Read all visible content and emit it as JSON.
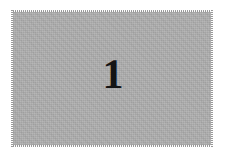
{
  "figure": {
    "kind": "scanned-plate",
    "number_label": "1",
    "caption": "",
    "plate": {
      "fill_color": "#adadad",
      "edge_style": "dithered",
      "x": 12,
      "y": 11,
      "width": 200,
      "height": 135
    },
    "page": {
      "background_color": "#ffffff",
      "width": 225,
      "height": 158
    },
    "number_style": {
      "color": "#141414",
      "font_size_px": 42,
      "weight": "bold",
      "family": "serif",
      "align": "center"
    }
  }
}
